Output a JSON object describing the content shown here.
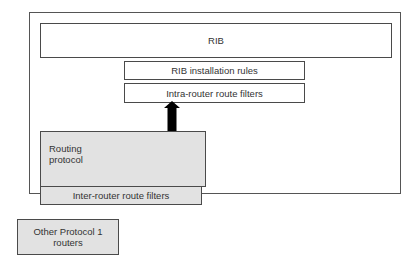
{
  "diagram": {
    "outer_container": {
      "label": ""
    },
    "rib": {
      "label": "RIB"
    },
    "rib_installation_rules": {
      "label": "RIB installation rules"
    },
    "intra_router_filters": {
      "label": "Intra-router route filters"
    },
    "routing_protocol": {
      "label_line1": "Routing",
      "label_line2": "protocol"
    },
    "inter_router_filters": {
      "label": "Inter-router route filters"
    },
    "other_routers": {
      "label_line1": "Other Protocol 1",
      "label_line2": "routers"
    },
    "arrow": {
      "from": "routing_protocol",
      "to": "intra_router_filters",
      "direction": "up"
    },
    "colors": {
      "border": "#4a4a4a",
      "gray_fill": "#e2e2e2",
      "white_fill": "#ffffff",
      "text": "#333333",
      "arrow": "#000000"
    }
  }
}
